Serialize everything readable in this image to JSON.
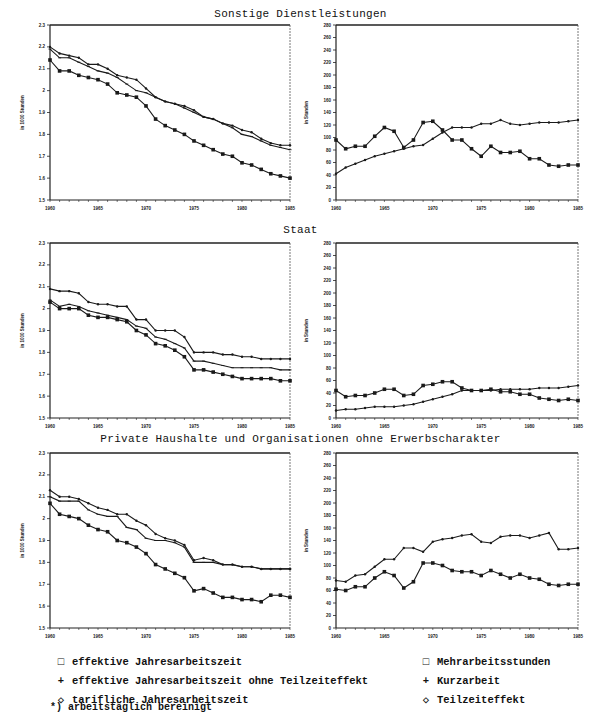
{
  "panels": [
    {
      "title": "Sonstige Dienstleistungen",
      "title_top": 8,
      "chart_top": 22
    },
    {
      "title": "Staat",
      "title_top": 224,
      "chart_top": 240
    },
    {
      "title": "Private Haushalte und Organisationen ohne Erwerbscharakter",
      "title_top": 433,
      "chart_top": 450
    }
  ],
  "legend_left": [
    {
      "symbol": "□",
      "label": "effektive Jahresarbeitszeit"
    },
    {
      "symbol": "+",
      "label": "effektive Jahresarbeitszeit ohne Teilzeiteffekt"
    },
    {
      "symbol": "◇",
      "label": "tarifliche Jahresarbeitszeit"
    }
  ],
  "legend_right": [
    {
      "symbol": "□",
      "label": "Mehrarbeitsstunden"
    },
    {
      "symbol": "+",
      "label": "Kurzarbeit"
    },
    {
      "symbol": "◇",
      "label": "Teilzeiteffekt"
    }
  ],
  "footnote": "*) arbeitstäglich bereinigt",
  "chart_data": [
    {
      "type": "line",
      "panel": "Sonstige Dienstleistungen",
      "side": "left",
      "ylabel": "in 1000 Stunden",
      "ylim": [
        1.5,
        2.3
      ],
      "yticks": [
        "1.5",
        "1.6",
        "1.7",
        "1.8",
        "1.9",
        "2",
        "2.1",
        "2.2",
        "2.3"
      ],
      "xticks": [
        "1960",
        "1965",
        "1970",
        "1975",
        "1980",
        "1985"
      ],
      "x": [
        1960,
        1961,
        1962,
        1963,
        1964,
        1965,
        1966,
        1967,
        1968,
        1969,
        1970,
        1971,
        1972,
        1973,
        1974,
        1975,
        1976,
        1977,
        1978,
        1979,
        1980,
        1981,
        1982,
        1983,
        1984,
        1985
      ],
      "series": [
        {
          "name": "effektive Jahresarbeitszeit",
          "values": [
            2.14,
            2.09,
            2.09,
            2.07,
            2.06,
            2.05,
            2.03,
            1.99,
            1.98,
            1.97,
            1.93,
            1.87,
            1.84,
            1.82,
            1.8,
            1.77,
            1.75,
            1.73,
            1.71,
            1.7,
            1.67,
            1.66,
            1.64,
            1.62,
            1.61,
            1.6
          ]
        },
        {
          "name": "effektive Jahresarbeitszeit ohne Teilzeiteffekt",
          "values": [
            2.19,
            2.15,
            2.15,
            2.13,
            2.11,
            2.09,
            2.08,
            2.06,
            2.03,
            2.0,
            1.99,
            1.97,
            1.95,
            1.94,
            1.92,
            1.9,
            1.88,
            1.87,
            1.85,
            1.83,
            1.8,
            1.79,
            1.77,
            1.75,
            1.74,
            1.73
          ]
        },
        {
          "name": "tarifliche Jahresarbeitszeit",
          "values": [
            2.2,
            2.17,
            2.16,
            2.15,
            2.12,
            2.12,
            2.1,
            2.07,
            2.06,
            2.05,
            2.01,
            1.97,
            1.95,
            1.94,
            1.93,
            1.91,
            1.88,
            1.87,
            1.85,
            1.84,
            1.82,
            1.81,
            1.78,
            1.76,
            1.75,
            1.75
          ]
        }
      ]
    },
    {
      "type": "line",
      "panel": "Sonstige Dienstleistungen",
      "side": "right",
      "ylabel": "in Stunden",
      "ylim": [
        0,
        280
      ],
      "yticks": [
        "0",
        "20",
        "40",
        "60",
        "80",
        "100",
        "120",
        "140",
        "160",
        "180",
        "200",
        "220",
        "240",
        "260",
        "280"
      ],
      "xticks": [
        "1960",
        "1965",
        "1970",
        "1975",
        "1980",
        "1985"
      ],
      "x": [
        1960,
        1961,
        1962,
        1963,
        1964,
        1965,
        1966,
        1967,
        1968,
        1969,
        1970,
        1971,
        1972,
        1973,
        1974,
        1975,
        1976,
        1977,
        1978,
        1979,
        1980,
        1981,
        1982,
        1983,
        1984,
        1985
      ],
      "series": [
        {
          "name": "Mehrarbeitsstunden",
          "values": [
            96,
            82,
            86,
            86,
            102,
            116,
            110,
            84,
            96,
            124,
            126,
            112,
            96,
            96,
            82,
            70,
            86,
            76,
            76,
            78,
            66,
            66,
            56,
            54,
            56,
            56
          ]
        },
        {
          "name": "Teilzeiteffekt",
          "values": [
            42,
            52,
            58,
            64,
            70,
            74,
            78,
            82,
            86,
            88,
            98,
            108,
            116,
            116,
            116,
            122,
            122,
            128,
            122,
            120,
            122,
            124,
            124,
            124,
            126,
            128
          ]
        }
      ]
    },
    {
      "type": "line",
      "panel": "Staat",
      "side": "left",
      "ylabel": "in 1000 Stunden",
      "ylim": [
        1.5,
        2.3
      ],
      "yticks": [
        "1.5",
        "1.6",
        "1.7",
        "1.8",
        "1.9",
        "2",
        "2.1",
        "2.2",
        "2.3"
      ],
      "xticks": [
        "1960",
        "1965",
        "1970",
        "1975",
        "1980",
        "1985"
      ],
      "x": [
        1960,
        1961,
        1962,
        1963,
        1964,
        1965,
        1966,
        1967,
        1968,
        1969,
        1970,
        1971,
        1972,
        1973,
        1974,
        1975,
        1976,
        1977,
        1978,
        1979,
        1980,
        1981,
        1982,
        1983,
        1984,
        1985
      ],
      "series": [
        {
          "name": "effektive Jahresarbeitszeit",
          "values": [
            2.03,
            2.0,
            2.0,
            2.0,
            1.97,
            1.96,
            1.96,
            1.95,
            1.94,
            1.9,
            1.88,
            1.84,
            1.83,
            1.81,
            1.78,
            1.72,
            1.72,
            1.71,
            1.7,
            1.69,
            1.68,
            1.68,
            1.68,
            1.68,
            1.67,
            1.67
          ]
        },
        {
          "name": "effektive Jahresarbeitszeit ohne Teilzeiteffekt",
          "values": [
            2.04,
            2.01,
            2.02,
            2.01,
            1.99,
            1.98,
            1.97,
            1.96,
            1.95,
            1.92,
            1.91,
            1.87,
            1.86,
            1.84,
            1.82,
            1.76,
            1.76,
            1.75,
            1.74,
            1.73,
            1.73,
            1.73,
            1.73,
            1.73,
            1.72,
            1.72
          ]
        },
        {
          "name": "tarifliche Jahresarbeitszeit",
          "values": [
            2.09,
            2.08,
            2.08,
            2.07,
            2.03,
            2.02,
            2.02,
            2.01,
            2.01,
            1.95,
            1.95,
            1.9,
            1.9,
            1.9,
            1.87,
            1.8,
            1.8,
            1.8,
            1.79,
            1.79,
            1.78,
            1.78,
            1.77,
            1.77,
            1.77,
            1.77
          ]
        }
      ]
    },
    {
      "type": "line",
      "panel": "Staat",
      "side": "right",
      "ylabel": "in Stunden",
      "ylim": [
        0,
        280
      ],
      "yticks": [
        "0",
        "20",
        "40",
        "60",
        "80",
        "100",
        "120",
        "140",
        "160",
        "180",
        "200",
        "220",
        "240",
        "260",
        "280"
      ],
      "xticks": [
        "1960",
        "1965",
        "1970",
        "1975",
        "1980",
        "1985"
      ],
      "x": [
        1960,
        1961,
        1962,
        1963,
        1964,
        1965,
        1966,
        1967,
        1968,
        1969,
        1970,
        1971,
        1972,
        1973,
        1974,
        1975,
        1976,
        1977,
        1978,
        1979,
        1980,
        1981,
        1982,
        1983,
        1984,
        1985
      ],
      "series": [
        {
          "name": "Mehrarbeitsstunden",
          "values": [
            44,
            34,
            36,
            36,
            40,
            46,
            46,
            36,
            38,
            52,
            54,
            58,
            58,
            48,
            44,
            44,
            46,
            42,
            42,
            38,
            38,
            32,
            30,
            28,
            30,
            28
          ]
        },
        {
          "name": "Teilzeiteffekt",
          "values": [
            12,
            14,
            14,
            16,
            18,
            18,
            18,
            20,
            22,
            26,
            30,
            34,
            38,
            44,
            44,
            44,
            44,
            46,
            46,
            46,
            46,
            48,
            48,
            48,
            50,
            52
          ]
        }
      ]
    },
    {
      "type": "line",
      "panel": "Private Haushalte und Organisationen ohne Erwerbscharakter",
      "side": "left",
      "ylabel": "in 1000 Stunden",
      "ylim": [
        1.5,
        2.3
      ],
      "yticks": [
        "1.5",
        "1.6",
        "1.7",
        "1.8",
        "1.9",
        "2",
        "2.1",
        "2.2",
        "2.3"
      ],
      "xticks": [
        "1960",
        "1965",
        "1970",
        "1975",
        "1980",
        "1985"
      ],
      "x": [
        1960,
        1961,
        1962,
        1963,
        1964,
        1965,
        1966,
        1967,
        1968,
        1969,
        1970,
        1971,
        1972,
        1973,
        1974,
        1975,
        1976,
        1977,
        1978,
        1979,
        1980,
        1981,
        1982,
        1983,
        1984,
        1985
      ],
      "series": [
        {
          "name": "effektive Jahresarbeitszeit",
          "values": [
            2.07,
            2.02,
            2.01,
            2.0,
            1.97,
            1.95,
            1.94,
            1.9,
            1.89,
            1.87,
            1.84,
            1.79,
            1.77,
            1.75,
            1.73,
            1.67,
            1.68,
            1.66,
            1.64,
            1.64,
            1.63,
            1.63,
            1.62,
            1.65,
            1.65,
            1.64
          ]
        },
        {
          "name": "effektive Jahresarbeitszeit ohne Teilzeiteffekt",
          "values": [
            2.1,
            2.08,
            2.08,
            2.08,
            2.04,
            2.02,
            2.01,
            2.01,
            1.96,
            1.95,
            1.91,
            1.9,
            1.9,
            1.89,
            1.87,
            1.8,
            1.8,
            1.8,
            1.79,
            1.79,
            1.78,
            1.78,
            1.77,
            1.77,
            1.77,
            1.77
          ]
        },
        {
          "name": "tarifliche Jahresarbeitszeit",
          "values": [
            2.13,
            2.1,
            2.1,
            2.09,
            2.07,
            2.05,
            2.04,
            2.02,
            2.02,
            1.99,
            1.97,
            1.93,
            1.91,
            1.9,
            1.88,
            1.81,
            1.82,
            1.81,
            1.79,
            1.79,
            1.78,
            1.78,
            1.77,
            1.77,
            1.77,
            1.77
          ]
        }
      ]
    },
    {
      "type": "line",
      "panel": "Private Haushalte und Organisationen ohne Erwerbscharakter",
      "side": "right",
      "ylabel": "in Stunden",
      "ylim": [
        0,
        280
      ],
      "yticks": [
        "0",
        "20",
        "40",
        "60",
        "80",
        "100",
        "120",
        "140",
        "160",
        "180",
        "200",
        "220",
        "240",
        "260",
        "280"
      ],
      "xticks": [
        "1960",
        "1965",
        "1970",
        "1975",
        "1980",
        "1985"
      ],
      "x": [
        1960,
        1961,
        1962,
        1963,
        1964,
        1965,
        1966,
        1967,
        1968,
        1969,
        1970,
        1971,
        1972,
        1973,
        1974,
        1975,
        1976,
        1977,
        1978,
        1979,
        1980,
        1981,
        1982,
        1983,
        1984,
        1985
      ],
      "series": [
        {
          "name": "Mehrarbeitsstunden",
          "values": [
            62,
            60,
            66,
            66,
            80,
            90,
            84,
            64,
            74,
            104,
            104,
            100,
            92,
            90,
            90,
            84,
            92,
            86,
            80,
            86,
            80,
            78,
            70,
            68,
            70,
            70
          ]
        },
        {
          "name": "Teilzeiteffekt",
          "values": [
            76,
            74,
            84,
            86,
            98,
            110,
            110,
            128,
            128,
            122,
            138,
            142,
            144,
            148,
            150,
            138,
            136,
            146,
            148,
            148,
            144,
            148,
            152,
            126,
            126,
            128
          ]
        }
      ]
    }
  ]
}
